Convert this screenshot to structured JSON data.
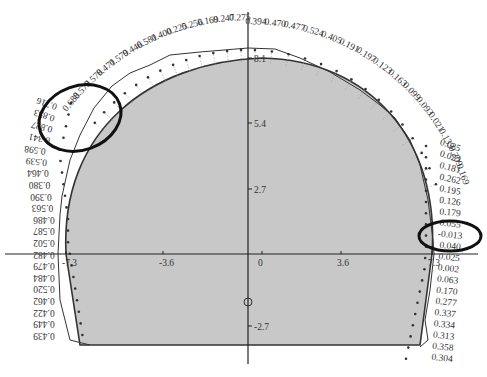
{
  "diagram": {
    "type": "tunnel-cross-section-deformation-plot",
    "colors": {
      "section_fill": "#c8c8c8",
      "section_stroke": "#333333",
      "curve_stroke": "#333333",
      "highlight_ellipse": "#111111",
      "axis": "#222222",
      "label_text": "#333333"
    },
    "axes": {
      "x_ticks": [
        {
          "label": "-7.3",
          "x": 66
        },
        {
          "label": "-3.6",
          "x": 163
        },
        {
          "label": "0",
          "x": 262
        },
        {
          "label": "3.6",
          "x": 341
        },
        {
          "label": "7.3",
          "x": 432
        }
      ],
      "y_ticks": [
        {
          "label": "8.1",
          "y": 58
        },
        {
          "label": "5.4",
          "y": 123
        },
        {
          "label": "2.7",
          "y": 189
        },
        {
          "label": "0",
          "y": 254
        },
        {
          "label": "-2.7",
          "y": 326
        }
      ]
    },
    "center_marker": "circle-icon",
    "top_left_values": [
      "0.688",
      "0.578",
      "0.578",
      "0.471",
      "0.579",
      "0.446",
      "0.581",
      "0.400",
      "0.225",
      "0.256",
      "0.169",
      "0.247",
      "0.275"
    ],
    "top_right_values": [
      "0.394",
      "0.470",
      "0.477",
      "0.524",
      "0.405",
      "0.191",
      "0.197",
      "0.123",
      "0.163",
      "0.099",
      "0.093",
      "0.021",
      "0.133",
      "0.209",
      "0.169"
    ],
    "left_values": [
      "0.716",
      "0.853",
      "0.827",
      "0.341",
      "0.598",
      "0.539",
      "0.464",
      "0.380",
      "0.390",
      "0.563",
      "0.486",
      "0.587",
      "0.502",
      "0.482",
      "0.479",
      "0.484",
      "0.520",
      "0.462",
      "0.422",
      "0.449",
      "0.439"
    ],
    "right_values": [
      "0.025",
      "0.023",
      "0.181",
      "0.262",
      "0.195",
      "0.126",
      "0.179",
      "0.055",
      "-0.013",
      "0.040",
      "0.025",
      "0.002",
      "0.063",
      "0.170",
      "0.277",
      "0.337",
      "0.334",
      "0.313",
      "0.358",
      "0.304"
    ],
    "highlights": [
      {
        "name": "left-highlight",
        "label": "left shoulder region"
      },
      {
        "name": "right-highlight",
        "label": "right springline region"
      }
    ]
  }
}
